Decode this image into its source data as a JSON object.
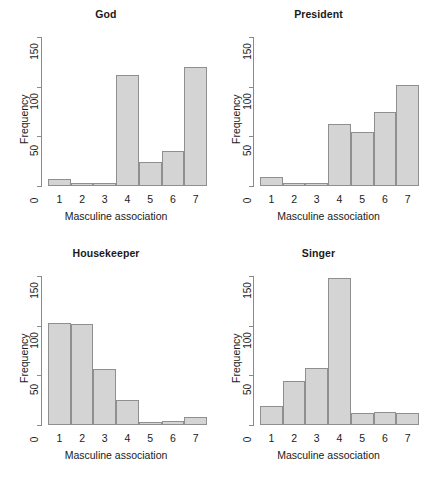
{
  "figure": {
    "type": "multi-panel-histogram",
    "panel_count": 4,
    "shared_xlabel": "Masculine association",
    "shared_ylabel": "Frequency",
    "bar_fill_color": "#d4d4d4",
    "bar_border_color": "#8f8f8f",
    "axis_color": "#8a8a8a"
  },
  "chart_data": [
    {
      "type": "bar",
      "title": "God",
      "xlabel": "Masculine association",
      "ylabel": "Frequency",
      "categories": [
        "1",
        "2",
        "3",
        "4",
        "5",
        "6",
        "7"
      ],
      "values": [
        7,
        2,
        2,
        112,
        24,
        35,
        120
      ],
      "ylim": [
        0,
        150
      ],
      "yticks": [
        0,
        50,
        100,
        150
      ],
      "grid": false,
      "legend": null
    },
    {
      "type": "bar",
      "title": "President",
      "xlabel": "Masculine association",
      "ylabel": "Frequency",
      "categories": [
        "1",
        "2",
        "3",
        "4",
        "5",
        "6",
        "7"
      ],
      "values": [
        9,
        1,
        2,
        62,
        54,
        75,
        102
      ],
      "ylim": [
        0,
        150
      ],
      "yticks": [
        0,
        50,
        100,
        150
      ],
      "grid": false,
      "legend": null
    },
    {
      "type": "bar",
      "title": "Housekeeper",
      "xlabel": "Masculine association",
      "ylabel": "Frequency",
      "categories": [
        "1",
        "2",
        "3",
        "4",
        "5",
        "6",
        "7"
      ],
      "values": [
        103,
        102,
        56,
        25,
        3,
        4,
        8
      ],
      "ylim": [
        0,
        150
      ],
      "yticks": [
        0,
        50,
        100,
        150
      ],
      "grid": false,
      "legend": null
    },
    {
      "type": "bar",
      "title": "Singer",
      "xlabel": "Masculine association",
      "ylabel": "Frequency",
      "categories": [
        "1",
        "2",
        "3",
        "4",
        "5",
        "6",
        "7"
      ],
      "values": [
        19,
        44,
        57,
        148,
        12,
        13,
        12
      ],
      "ylim": [
        0,
        150
      ],
      "yticks": [
        0,
        50,
        100,
        150
      ],
      "grid": false,
      "legend": null
    }
  ]
}
